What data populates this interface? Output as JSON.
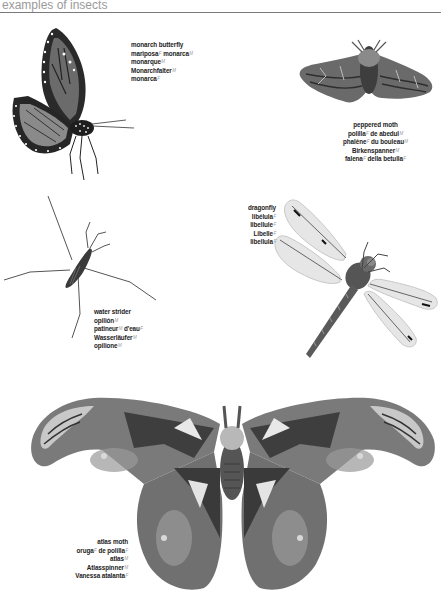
{
  "header": {
    "title": "examples of insects"
  },
  "insects": [
    {
      "id": "monarch-butterfly",
      "names": [
        {
          "parts": [
            {
              "text": "monarch butterfly"
            }
          ]
        },
        {
          "parts": [
            {
              "text": "mariposa",
              "gender": "F"
            },
            {
              "text": " monarca",
              "gender": "M"
            }
          ]
        },
        {
          "parts": [
            {
              "text": "monarque",
              "gender": "M"
            }
          ]
        },
        {
          "parts": [
            {
              "text": "Monarchfalter",
              "gender": "M"
            }
          ]
        },
        {
          "parts": [
            {
              "text": "monarca",
              "gender": "F"
            }
          ]
        }
      ]
    },
    {
      "id": "peppered-moth",
      "names": [
        {
          "parts": [
            {
              "text": "peppered moth"
            }
          ]
        },
        {
          "parts": [
            {
              "text": "polilla",
              "gender": "F"
            },
            {
              "text": " de abedul",
              "gender": "M"
            }
          ]
        },
        {
          "parts": [
            {
              "text": "phalène",
              "gender": "F"
            },
            {
              "text": " du bouleau",
              "gender": "M"
            }
          ]
        },
        {
          "parts": [
            {
              "text": "Birkenspanner",
              "gender": "M"
            }
          ]
        },
        {
          "parts": [
            {
              "text": "falena",
              "gender": "F"
            },
            {
              "text": " della betulla",
              "gender": "F"
            }
          ]
        }
      ]
    },
    {
      "id": "dragonfly",
      "names": [
        {
          "parts": [
            {
              "text": "dragonfly"
            }
          ]
        },
        {
          "parts": [
            {
              "text": "libélula",
              "gender": "F"
            }
          ]
        },
        {
          "parts": [
            {
              "text": "libellule",
              "gender": "F"
            }
          ]
        },
        {
          "parts": [
            {
              "text": "Libelle",
              "gender": "F"
            }
          ]
        },
        {
          "parts": [
            {
              "text": "libellula",
              "gender": "F"
            }
          ]
        }
      ]
    },
    {
      "id": "water-strider",
      "names": [
        {
          "parts": [
            {
              "text": "water strider"
            }
          ]
        },
        {
          "parts": [
            {
              "text": "opilión",
              "gender": "M"
            }
          ]
        },
        {
          "parts": [
            {
              "text": "patineur",
              "gender": "M"
            },
            {
              "text": " d'eau",
              "gender": "F"
            }
          ]
        },
        {
          "parts": [
            {
              "text": "Wasserläufer",
              "gender": "M"
            }
          ]
        },
        {
          "parts": [
            {
              "text": "opilione",
              "gender": "M"
            }
          ]
        }
      ]
    },
    {
      "id": "atlas-moth",
      "names": [
        {
          "parts": [
            {
              "text": "atlas moth"
            }
          ]
        },
        {
          "parts": [
            {
              "text": "oruga",
              "gender": "F"
            },
            {
              "text": " de polilla",
              "gender": "F"
            }
          ]
        },
        {
          "parts": [
            {
              "text": "atlas",
              "gender": "M"
            }
          ]
        },
        {
          "parts": [
            {
              "text": "Atlasspinner",
              "gender": "M"
            }
          ]
        },
        {
          "parts": [
            {
              "text": "Vanessa atalanta",
              "gender": "F"
            }
          ]
        }
      ]
    }
  ]
}
